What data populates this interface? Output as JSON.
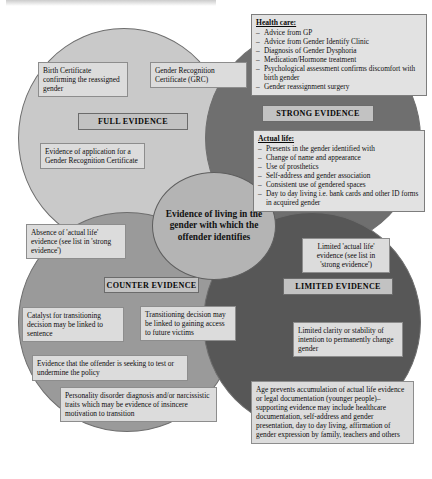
{
  "diagram": {
    "centre": {
      "label": "Evidence of living in the gender with which the offender identifies"
    },
    "regions": [
      {
        "id": "full",
        "label": "FULL EVIDENCE",
        "color": "#c9c9c9"
      },
      {
        "id": "strong",
        "label": "STRONG EVIDENCE",
        "color": "#6f6f6f"
      },
      {
        "id": "counter",
        "label": "COUNTER EVIDENCE",
        "color": "#9a9a9a"
      },
      {
        "id": "limited",
        "label": "LIMITED EVIDENCE",
        "color": "#575757"
      }
    ],
    "boxes": {
      "birth_certificate": "Birth Certificate confirming the reassigned gender",
      "grc": "Gender Recognition Certificate (GRC)",
      "gra_application": "Evidence of application for a Gender Recognition Certificate",
      "absence_actual_life": "Absence of 'actual life' evidence (see list in 'strong evidence')",
      "catalyst": "Catalyst for transitioning decision may be linked to sentence",
      "transitioning_access": "Transitioning decision may be linked to gaining access to future victims",
      "seeking_to_test": "Evidence that the offender is seeking to test or undermine the policy",
      "personality_disorder": "Personality disorder diagnosis and/or narcissistic traits which may be evidence of insincere motivation to transition",
      "limited_actual_life": "Limited 'actual life' evidence (see list in 'strong evidence')",
      "limited_clarity": "Limited clarity or stability of intention to permanently change gender",
      "age_prevents": "Age prevents accumulation of actual life evidence or legal documentation (younger people)–supporting evidence may include healthcare documentation, self-address and gender presentation, day to day living, affirmation of gender expression by family, teachers and others"
    },
    "lists": {
      "health_care": {
        "heading": "Health care:",
        "items": [
          "Advice from GP",
          "Advice from Gender Identify Clinic",
          "Diagnosis of Gender Dysphoria",
          "Medication/Hormone treatment",
          "Psychological assessment confirms discomfort with birth gender",
          "Gender reassignment surgery"
        ]
      },
      "actual_life": {
        "heading": "Actual life:",
        "items": [
          "Presents in the gender identified with",
          "Change of name and appearance",
          "Use of prosthetics",
          "Self-address and gender association",
          "Consistent use of gendered spaces",
          "Day to day living i.e. bank cards and other ID forms in acquired gender"
        ]
      }
    }
  }
}
